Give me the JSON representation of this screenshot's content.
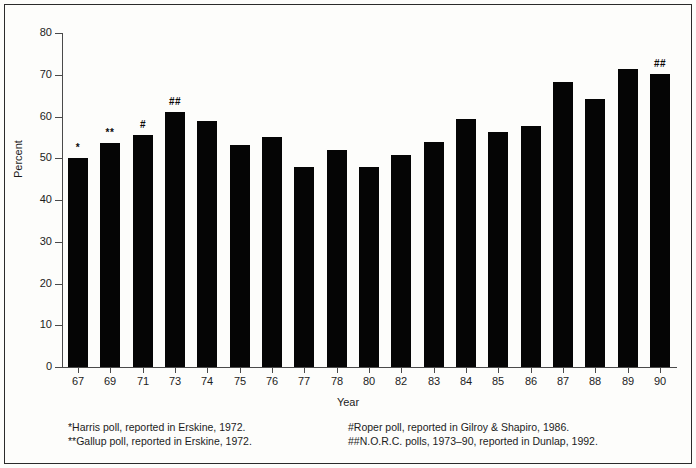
{
  "chart_data": {
    "type": "bar",
    "title": "",
    "xlabel": "Year",
    "ylabel": "Percent",
    "ylim": [
      0,
      80
    ],
    "ytick_step": 10,
    "yticks": [
      0,
      10,
      20,
      30,
      40,
      50,
      60,
      70,
      80
    ],
    "grid": false,
    "legend": "none",
    "bar_color": "#050505",
    "categories": [
      "67",
      "69",
      "71",
      "73",
      "74",
      "75",
      "76",
      "77",
      "78",
      "80",
      "82",
      "83",
      "84",
      "85",
      "86",
      "87",
      "88",
      "89",
      "90"
    ],
    "values": [
      50.0,
      53.7,
      55.5,
      61.0,
      59.0,
      53.2,
      55.2,
      48.0,
      52.0,
      48.0,
      50.8,
      54.0,
      59.3,
      56.2,
      57.7,
      68.2,
      64.3,
      71.3,
      70.2
    ],
    "annotations": [
      {
        "category": "67",
        "marker": "*"
      },
      {
        "category": "69",
        "marker": "**"
      },
      {
        "category": "71",
        "marker": "#"
      },
      {
        "category": "73",
        "marker": "##"
      },
      {
        "category": "90",
        "marker": "##"
      }
    ]
  },
  "footnotes": {
    "left": [
      "*Harris poll, reported in Erskine, 1972.",
      "**Gallup poll, reported in Erskine, 1972."
    ],
    "right": [
      "#Roper poll, reported in Gilroy & Shapiro, 1986.",
      "##N.O.R.C. polls, 1973–90, reported in Dunlap, 1992."
    ]
  }
}
